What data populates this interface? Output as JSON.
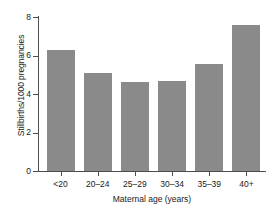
{
  "chart_data": {
    "type": "bar",
    "title": "",
    "categories": [
      "<20",
      "20–24",
      "25–29",
      "30–34",
      "35–39",
      "40+"
    ],
    "values": [
      6.3,
      5.1,
      4.6,
      4.65,
      5.55,
      7.6
    ],
    "xlabel": "Maternal age (years)",
    "ylabel": "Stillbirths/1000 pregnancies",
    "ylim": [
      0,
      8
    ],
    "yticks": [
      0,
      2,
      4,
      6,
      8
    ],
    "ytick_labels": [
      "0",
      "2",
      "4",
      "6",
      "8"
    ],
    "grid": false,
    "legend": null,
    "bar_color": "#8a8a8a",
    "axis_color": "#4d4d4d",
    "text_color": "#1a1a1a",
    "background": "#ffffff"
  }
}
